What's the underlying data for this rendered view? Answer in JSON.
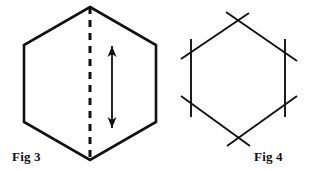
{
  "document": {
    "kind": "line-drawing",
    "background_color": "#ffffff",
    "stroke_color": "#111111",
    "figure_count": 2
  },
  "figures": [
    {
      "id": "fig3",
      "label": "Fig 3",
      "label_position": {
        "x": 12,
        "y": 161
      },
      "shape": "hexagon",
      "description": "Hexagon with vertical dashed line of symmetry and a vertical double-headed arrow",
      "hexagon": {
        "points": "90,7 156,45 156,122 90,160 24,122 24,45",
        "stroke_width": 2.6,
        "fill": "none",
        "vertices": [
          {
            "name": "top",
            "x": 90,
            "y": 7
          },
          {
            "name": "upper-right",
            "x": 156,
            "y": 45
          },
          {
            "name": "lower-right",
            "x": 156,
            "y": 122
          },
          {
            "name": "bottom",
            "x": 90,
            "y": 160
          },
          {
            "name": "lower-left",
            "x": 24,
            "y": 122
          },
          {
            "name": "upper-left",
            "x": 24,
            "y": 45
          }
        ]
      },
      "dashed_line": {
        "name": "line-of-symmetry",
        "x1": 90,
        "y1": 7,
        "x2": 90,
        "y2": 160,
        "stroke_width": 3,
        "dash_pattern": "7 6"
      },
      "arrow": {
        "name": "double-headed-arrow",
        "x": 112,
        "y_top": 46,
        "y_bottom": 128,
        "stroke_width": 1.8,
        "head_half_width": 4.5,
        "head_length": 11,
        "heads": "both"
      }
    },
    {
      "id": "fig4",
      "label": "Fig 4",
      "label_position": {
        "x": 254,
        "y": 161
      },
      "shape": "hexagon-with-extended-sides",
      "description": "Hexagon drawn with each side extended past the vertices so the lines cross",
      "hexagon": {
        "stroke_width": 1.9,
        "fill": "none",
        "vertices": [
          {
            "name": "top",
            "x": 238,
            "y": 20
          },
          {
            "name": "upper-right",
            "x": 285,
            "y": 52
          },
          {
            "name": "lower-right",
            "x": 285,
            "y": 104
          },
          {
            "name": "bottom",
            "x": 238,
            "y": 138
          },
          {
            "name": "lower-left",
            "x": 191,
            "y": 103
          },
          {
            "name": "upper-left",
            "x": 191,
            "y": 52
          }
        ],
        "extended_sides": [
          {
            "name": "upper-left-side",
            "x1": 181,
            "y1": 59,
            "x2": 249,
            "y2": 13
          },
          {
            "name": "upper-right-side",
            "x1": 226,
            "y1": 12,
            "x2": 297,
            "y2": 61
          },
          {
            "name": "right-side",
            "x1": 285,
            "y1": 39,
            "x2": 285,
            "y2": 117
          },
          {
            "name": "lower-right-side",
            "x1": 297,
            "y1": 96,
            "x2": 227,
            "y2": 146
          },
          {
            "name": "lower-left-side",
            "x1": 250,
            "y1": 146,
            "x2": 181,
            "y2": 96
          },
          {
            "name": "left-side",
            "x1": 191,
            "y1": 39,
            "x2": 191,
            "y2": 117
          }
        ]
      }
    }
  ]
}
